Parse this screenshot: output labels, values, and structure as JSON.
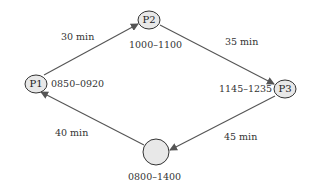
{
  "diagram": {
    "nodes": [
      {
        "id": "P1",
        "label": "P1",
        "time_window": "0850–0920"
      },
      {
        "id": "P2",
        "label": "P2",
        "time_window": "1000–1100"
      },
      {
        "id": "P3",
        "label": "P3",
        "time_window": "1145–1235"
      },
      {
        "id": "depot",
        "label": "",
        "time_window": "0800–1400"
      }
    ],
    "edges": [
      {
        "from": "P1",
        "to": "P2",
        "label": "30 min"
      },
      {
        "from": "P2",
        "to": "P3",
        "label": "35 min"
      },
      {
        "from": "P3",
        "to": "depot",
        "label": "45 min"
      },
      {
        "from": "depot",
        "to": "P1",
        "label": "40 min"
      }
    ],
    "colors": {
      "node_fill": "#e8e8e8",
      "node_stroke": "#333333",
      "edge": "#555555",
      "text": "#333333"
    }
  }
}
